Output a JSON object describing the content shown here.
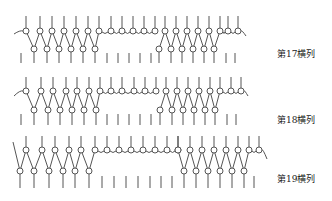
{
  "diagram": {
    "type": "knitting-notation",
    "stroke_color": "#555555",
    "rows": [
      {
        "label": "第17横列",
        "label_pos": [
          277,
          53
        ],
        "y_top": 16,
        "y_upper": 31,
        "y_lower": 49,
        "y_mark_top": 53,
        "y_mark_bot": 63,
        "lead_in": [
          14,
          34
        ],
        "segments": [
          {
            "kind": "knit",
            "x_upper": [
              26,
              40,
              52,
              64,
              76,
              88,
              99
            ],
            "x_lower": [
              34,
              47,
              59,
              71,
              83,
              95
            ]
          },
          {
            "kind": "float",
            "x_upper": [
              111,
              122,
              133,
              144,
              155
            ]
          },
          {
            "kind": "knit",
            "x_upper": [
              165,
              176,
              187,
              198,
              209,
              220
            ],
            "x_lower": [
              159,
              171,
              182,
              193,
              204,
              214
            ]
          },
          {
            "kind": "float",
            "x_upper": [
              228,
              238
            ]
          }
        ],
        "lead_out": [
          246,
          33
        ],
        "marks": [
          21,
          34,
          47,
          59,
          71,
          83,
          95,
          107,
          118,
          129,
          140,
          151,
          159,
          171,
          182,
          193,
          204,
          214,
          226,
          235
        ]
      },
      {
        "label": "第18横列",
        "label_pos": [
          277,
          119
        ],
        "y_top": 77,
        "y_upper": 91,
        "y_lower": 110,
        "y_mark_top": 114,
        "y_mark_bot": 125,
        "lead_in": [
          14,
          96
        ],
        "segments": [
          {
            "kind": "knit",
            "x_upper": [
              26,
              41,
              53,
              66,
              77,
              89,
              100
            ],
            "x_lower": [
              34,
              48,
              60,
              72,
              84,
              96
            ]
          },
          {
            "kind": "float",
            "x_upper": [
              111,
              122,
              134,
              145,
              156
            ]
          },
          {
            "kind": "knit",
            "x_upper": [
              166,
              177,
              188,
              199,
              210,
              220
            ],
            "x_lower": [
              160,
              172,
              183,
              194,
              205,
              215
            ]
          },
          {
            "kind": "float",
            "x_upper": [
              231,
              241
            ]
          }
        ],
        "lead_out": [
          248,
          93
        ],
        "marks": [
          21,
          34,
          48,
          60,
          72,
          84,
          96,
          107,
          118,
          129,
          140,
          151,
          160,
          172,
          183,
          194,
          205,
          215,
          227,
          236
        ]
      },
      {
        "label": "第19横列",
        "label_pos": [
          277,
          178
        ],
        "y_top": 136,
        "y_upper": 150,
        "y_lower": 171,
        "y_mark_top": 176,
        "y_mark_bot": 188,
        "lead_in_diag": [
          13,
          154
        ],
        "segments": [
          {
            "kind": "knit",
            "x_upper": [
              26,
              42,
              55,
              69,
              81,
              95
            ],
            "x_lower": [
              20,
              34,
              49,
              63,
              75,
              89
            ]
          },
          {
            "kind": "float",
            "x_upper": [
              107,
              119,
              131,
              143,
              155,
              167,
              178
            ]
          },
          {
            "kind": "knit",
            "x_upper": [
              178,
              190,
              202,
              214,
              226,
              238,
              249
            ],
            "x_lower": [
              184,
              196,
              208,
              220,
              232,
              244
            ]
          },
          {
            "kind": "float",
            "x_upper": [
              259
            ]
          }
        ],
        "lead_out": [
          267,
          156
        ],
        "marks": [
          20,
          34,
          49,
          63,
          75,
          89,
          102,
          114,
          126,
          138,
          150,
          161,
          172,
          184,
          196,
          208,
          220,
          232,
          244,
          254
        ]
      }
    ]
  }
}
